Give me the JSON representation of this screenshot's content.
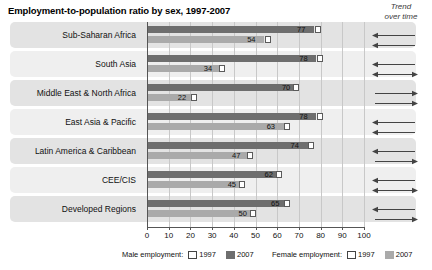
{
  "header": {
    "title": "Employment-to-population ratio by sex, 1997-2007",
    "trend_header_line1": "Trend",
    "trend_header_line2": "over time"
  },
  "legend": {
    "male_title": "Male employment:",
    "female_title": "Female employment:",
    "year_1997": "1997",
    "year_2007": "2007"
  },
  "colors": {
    "male_2007": "#6e6e6e",
    "female_2007": "#aaaaaa",
    "marker_1997": "#ffffff",
    "band_odd": "#e3e3e3",
    "band_even": "#efefef",
    "gridline": "#c8c8c8",
    "axis": "#555555"
  },
  "chart_data": {
    "type": "bar",
    "title": "Employment-to-population ratio by sex, 1997-2007",
    "xlabel": "",
    "ylabel": "",
    "orientation": "horizontal",
    "grouped": true,
    "grid": true,
    "legend_position": "bottom",
    "xlim": [
      0,
      100
    ],
    "xticks": [
      0,
      10,
      20,
      30,
      40,
      50,
      60,
      70,
      80,
      90,
      100
    ],
    "xtick_labels": [
      "0",
      "10",
      "20",
      "30",
      "40",
      "50",
      "60",
      "70",
      "80",
      "90",
      "100"
    ],
    "categories": [
      "Sub-Saharan Africa",
      "South Asia",
      "Middle East & North Africa",
      "East Asia & Pacific",
      "Latin America & Caribbean",
      "CEE/CIS",
      "Developed Regions"
    ],
    "series": [
      {
        "name": "Male employment 2007",
        "sex": "male",
        "year": "2007",
        "values": [
          77,
          78,
          70,
          78,
          74,
          62,
          65
        ]
      },
      {
        "name": "Female employment 2007",
        "sex": "female",
        "year": "2007",
        "values": [
          54,
          34,
          22,
          63,
          47,
          45,
          50
        ]
      },
      {
        "name": "Male employment 1997",
        "sex": "male",
        "year": "1997",
        "values": [
          80,
          81,
          70,
          81,
          77,
          62,
          66
        ]
      },
      {
        "name": "Female employment 1997",
        "sex": "female",
        "year": "1997",
        "values": [
          57,
          36,
          23,
          66,
          49,
          45,
          50
        ]
      }
    ],
    "trend_over_time": [
      {
        "category": "Sub-Saharan Africa",
        "male": "left",
        "female": "left"
      },
      {
        "category": "South Asia",
        "male": "left",
        "female": "both"
      },
      {
        "category": "Middle East & North Africa",
        "male": "right",
        "female": "right"
      },
      {
        "category": "East Asia & Pacific",
        "male": "left",
        "female": "left"
      },
      {
        "category": "Latin America & Caribbean",
        "male": "left",
        "female": "right"
      },
      {
        "category": "CEE/CIS",
        "male": "left",
        "female": "both"
      },
      {
        "category": "Developed Regions",
        "male": "left",
        "female": "right"
      }
    ]
  }
}
